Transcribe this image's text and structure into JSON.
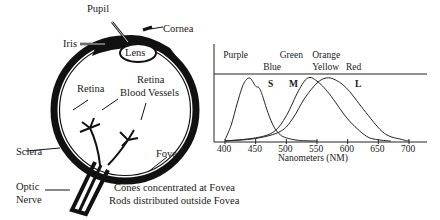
{
  "eye_diagram": {
    "labels": {
      "pupil": "Pupil",
      "cornea": "Cornea",
      "iris": "Iris",
      "lens": "Lens",
      "retina": "Retina",
      "retina_blood_vessels_1": "Retina",
      "retina_blood_vessels_2": "Blood Vessels",
      "fovea": "Fovea",
      "sclera": "Sclera",
      "optic_nerve_1": "Optic",
      "optic_nerve_2": "Nerve"
    },
    "caption": {
      "line1": "Cones concentrated at Fovea",
      "line2": "Rods distributed outside Fovea"
    }
  },
  "chart_data": {
    "type": "line",
    "title": "",
    "xlabel": "Nanometers (NM)",
    "ylabel": "",
    "xlim": [
      385,
      725
    ],
    "x_ticks": [
      400,
      450,
      500,
      550,
      600,
      650,
      700
    ],
    "color_labels": [
      {
        "text": "Purple",
        "row": 1,
        "x_nm": 420
      },
      {
        "text": "Green",
        "row": 1,
        "x_nm": 512
      },
      {
        "text": "Orange",
        "row": 1,
        "x_nm": 565
      },
      {
        "text": "Blue",
        "row": 2,
        "x_nm": 485
      },
      {
        "text": "Yellow",
        "row": 2,
        "x_nm": 565
      },
      {
        "text": "Red",
        "row": 2,
        "x_nm": 620
      }
    ],
    "series": [
      {
        "name": "S",
        "peak_nm": 440,
        "x": [
          400,
          410,
          420,
          430,
          440,
          450,
          455,
          460,
          470,
          480,
          490,
          500,
          520,
          550
        ],
        "y": [
          0.02,
          0.25,
          0.6,
          0.9,
          1.0,
          0.87,
          0.85,
          0.75,
          0.45,
          0.22,
          0.1,
          0.05,
          0.01,
          0
        ]
      },
      {
        "name": "M",
        "peak_nm": 535,
        "x": [
          400,
          450,
          480,
          500,
          520,
          535,
          550,
          570,
          600,
          630,
          650,
          670
        ],
        "y": [
          0,
          0.05,
          0.15,
          0.4,
          0.8,
          1.0,
          0.95,
          0.75,
          0.35,
          0.08,
          0.02,
          0
        ]
      },
      {
        "name": "L",
        "peak_nm": 565,
        "x": [
          400,
          450,
          490,
          510,
          530,
          550,
          565,
          580,
          600,
          630,
          660,
          690,
          700
        ],
        "y": [
          0,
          0.04,
          0.15,
          0.35,
          0.68,
          0.92,
          1.0,
          0.97,
          0.82,
          0.45,
          0.12,
          0.02,
          0
        ]
      }
    ],
    "series_labels": [
      "S",
      "M",
      "L"
    ],
    "grid": false,
    "legend": "none"
  }
}
